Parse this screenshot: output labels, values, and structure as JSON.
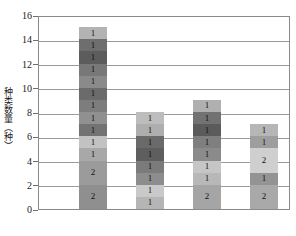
{
  "chart_data": {
    "type": "bar",
    "subtype": "stacked-bar",
    "title": "",
    "xlabel": "",
    "ylabel": "种类数量（种）",
    "ylim": [
      0,
      16
    ],
    "ytick_step": 2,
    "yticks": [
      "0",
      "2",
      "4",
      "6",
      "8",
      "10",
      "12",
      "14",
      "16"
    ],
    "grid": true,
    "grid_axis": "y",
    "legend": "none",
    "xtick_labels": [
      "",
      "",
      "",
      ""
    ],
    "categories": [
      "Bar 1",
      "Bar 2",
      "Bar 3",
      "Bar 4"
    ],
    "totals": [
      15,
      8,
      9,
      7
    ],
    "bars": [
      {
        "name": "Bar 1",
        "total": 15,
        "segments": [
          {
            "value": 1,
            "label": "1",
            "color": "#b3b3b3"
          },
          {
            "value": 1,
            "label": "1",
            "color": "#6e6e6e"
          },
          {
            "value": 1,
            "label": "1",
            "color": "#5c5c5c"
          },
          {
            "value": 1,
            "label": "1",
            "color": "#787878"
          },
          {
            "value": 1,
            "label": "1",
            "color": "#8a8a8a"
          },
          {
            "value": 1,
            "label": "1",
            "color": "#6b6b6b"
          },
          {
            "value": 1,
            "label": "1",
            "color": "#7d7d7d"
          },
          {
            "value": 1,
            "label": "1",
            "color": "#909090"
          },
          {
            "value": 1,
            "label": "1",
            "color": "#737373"
          },
          {
            "value": 1,
            "label": "1",
            "color": "#c2c2c2"
          },
          {
            "value": 1,
            "label": "1",
            "color": "#a8a8a8"
          },
          {
            "value": 2,
            "label": "2",
            "color": "#9b9b9b"
          },
          {
            "value": 2,
            "label": "2",
            "color": "#8f8f8f"
          }
        ]
      },
      {
        "name": "Bar 2",
        "total": 8,
        "segments": [
          {
            "value": 1,
            "label": "1",
            "color": "#bdbdbd"
          },
          {
            "value": 1,
            "label": "1",
            "color": "#aeaeae"
          },
          {
            "value": 1,
            "label": "1",
            "color": "#6a6a6a"
          },
          {
            "value": 1,
            "label": "1",
            "color": "#5e5e5e"
          },
          {
            "value": 1,
            "label": "1",
            "color": "#7b7b7b"
          },
          {
            "value": 1,
            "label": "1",
            "color": "#8d8d8d"
          },
          {
            "value": 1,
            "label": "1",
            "color": "#c9c9c9"
          },
          {
            "value": 1,
            "label": "1",
            "color": "#b5b5b5"
          }
        ]
      },
      {
        "name": "Bar 3",
        "total": 9,
        "segments": [
          {
            "value": 1,
            "label": "1",
            "color": "#b0b0b0"
          },
          {
            "value": 1,
            "label": "1",
            "color": "#727272"
          },
          {
            "value": 1,
            "label": "1",
            "color": "#5b5b5b"
          },
          {
            "value": 1,
            "label": "1",
            "color": "#7f7f7f"
          },
          {
            "value": 1,
            "label": "1",
            "color": "#8b8b8b"
          },
          {
            "value": 1,
            "label": "1",
            "color": "#c6c6c6"
          },
          {
            "value": 1,
            "label": "1",
            "color": "#b8b8b8"
          },
          {
            "value": 2,
            "label": "2",
            "color": "#a5a5a5"
          }
        ]
      },
      {
        "name": "Bar 4",
        "total": 7,
        "segments": [
          {
            "value": 1,
            "label": "1",
            "color": "#b6b6b6"
          },
          {
            "value": 1,
            "label": "1",
            "color": "#9e9e9e"
          },
          {
            "value": 2,
            "label": "2",
            "color": "#cfcfcf"
          },
          {
            "value": 1,
            "label": "1",
            "color": "#949494"
          },
          {
            "value": 2,
            "label": "2",
            "color": "#a9a9a9"
          }
        ]
      }
    ],
    "colors": {
      "axis": "#8a8a8a",
      "grid": "#9a9a9a",
      "text": "#1a1a1a",
      "background": "#ffffff"
    }
  }
}
